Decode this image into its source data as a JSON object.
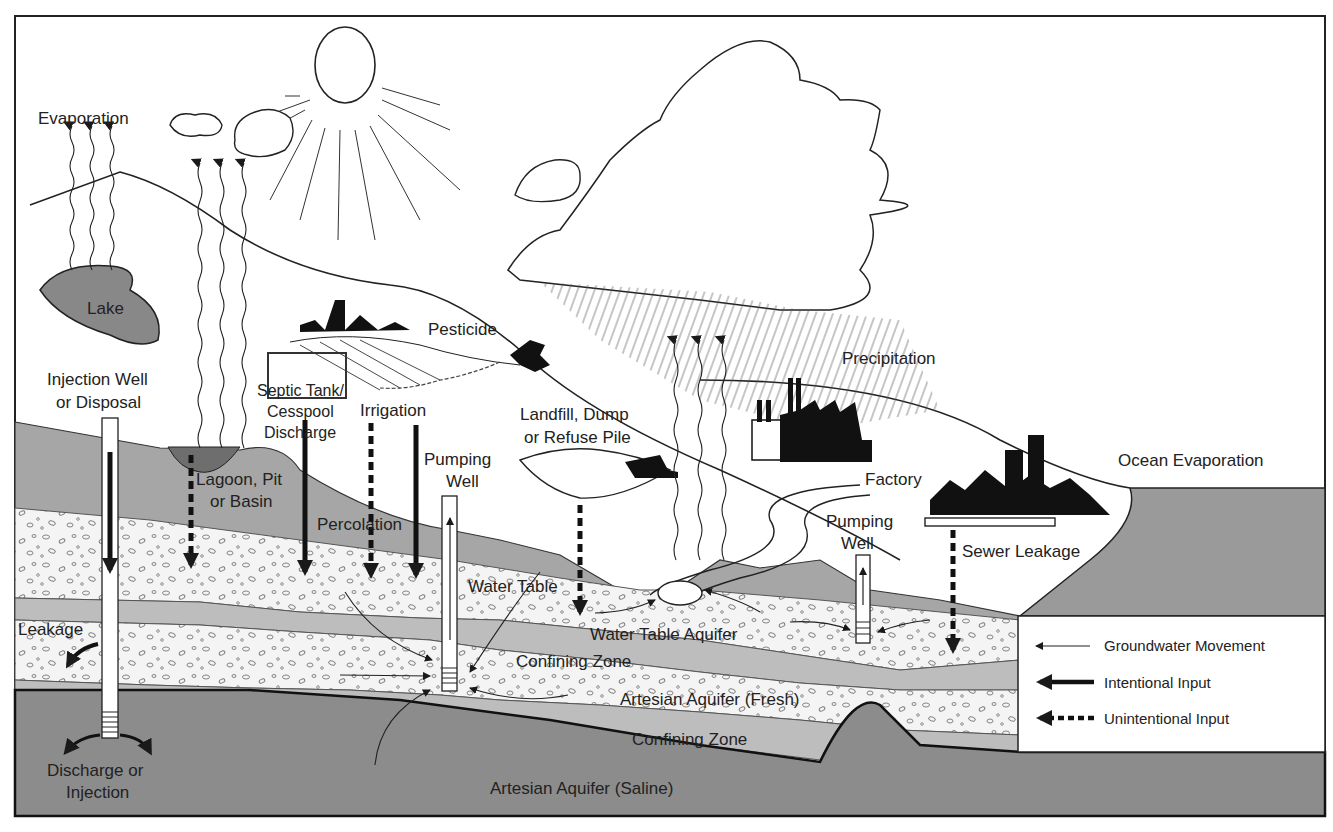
{
  "diagram": {
    "colors": {
      "surface_soil": "#a6a6a6",
      "aquifer": "#f4f4f4",
      "confining": "#bdbdbd",
      "saline": "#8c8c8c",
      "lagoon": "#6e6e6e",
      "ocean": "#9a9a9a",
      "line": "#1a1a1a"
    },
    "labels": {
      "evaporation": "Evaporation",
      "lake": "Lake",
      "pesticide": "Pesticide",
      "precipitation": "Precipitation",
      "injection_well_1": "Injection Well",
      "injection_well_2": "or Disposal",
      "septic_1": "Septic Tank/",
      "septic_2": "Cesspool",
      "septic_3": "Discharge",
      "irrigation": "Irrigation",
      "lagoon_1": "Lagoon, Pit",
      "lagoon_2": "or Basin",
      "percolation": "Percolation",
      "pumping_well_left_1": "Pumping",
      "pumping_well_left_2": "Well",
      "landfill_1": "Landfill, Dump",
      "landfill_2": "or Refuse Pile",
      "factory": "Factory",
      "pumping_well_right_1": "Pumping",
      "pumping_well_right_2": "Well",
      "sewer_leakage": "Sewer Leakage",
      "ocean_evaporation": "Ocean Evaporation",
      "water_table": "Water Table",
      "water_table_aquifer": "Water Table Aquifer",
      "confining_zone_upper": "Confining Zone",
      "artesian_fresh": "Artesian Aquifer (Fresh)",
      "confining_zone_lower": "Confining Zone",
      "artesian_saline": "Artesian Aquifer (Saline)",
      "leakage": "Leakage",
      "discharge_1": "Discharge or",
      "discharge_2": "Injection"
    },
    "legend": [
      {
        "label": "Groundwater Movement",
        "style": "thin-arrow"
      },
      {
        "label": "Intentional Input",
        "style": "thick-solid-arrow"
      },
      {
        "label": "Unintentional Input",
        "style": "thick-dashed-arrow"
      }
    ]
  }
}
